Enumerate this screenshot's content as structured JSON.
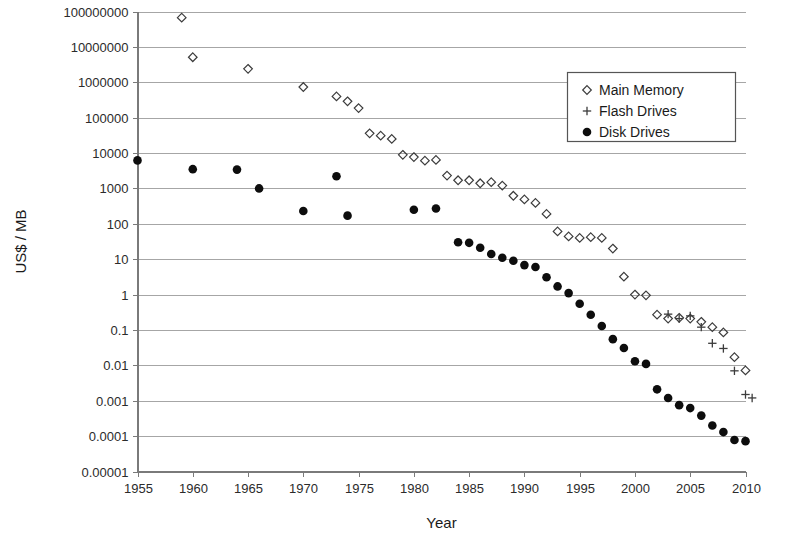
{
  "chart_data": {
    "type": "scatter",
    "title": "",
    "xlabel": "Year",
    "ylabel": "US$ / MB",
    "xlim": [
      1955,
      2010
    ],
    "ylim": [
      1e-05,
      100000000
    ],
    "yscale": "log",
    "xscale": "linear",
    "grid": "horizontal",
    "xticks": [
      1955,
      1960,
      1965,
      1970,
      1975,
      1980,
      1985,
      1990,
      1995,
      2000,
      2005,
      2010
    ],
    "xticklabels": [
      "1955",
      "1960",
      "1965",
      "1970",
      "1975",
      "1980",
      "1985",
      "1990",
      "1995",
      "2000",
      "2005",
      "2010"
    ],
    "yticks": [
      1e-05,
      0.0001,
      0.001,
      0.01,
      0.1,
      1,
      10,
      100,
      1000,
      10000,
      100000,
      1000000,
      10000000,
      100000000
    ],
    "yticklabels": [
      "0.00001",
      "0.0001",
      "0.001",
      "0.01",
      "0.1",
      "1",
      "10",
      "100",
      "1000",
      "10000",
      "100000",
      "1000000",
      "10000000",
      "100000000"
    ],
    "legend_position": "upper right",
    "series": [
      {
        "name": "Main Memory",
        "marker": "diamond",
        "color": "#3c3c3c",
        "points": [
          [
            1957,
            411000000
          ],
          [
            1959,
            67000000
          ],
          [
            1960,
            5100000
          ],
          [
            1965,
            2400000
          ],
          [
            1970,
            734000
          ],
          [
            1973,
            399000
          ],
          [
            1974,
            290000
          ],
          [
            1975,
            186000
          ],
          [
            1976,
            36000
          ],
          [
            1977,
            31000
          ],
          [
            1978,
            25000
          ],
          [
            1979,
            8900
          ],
          [
            1980,
            7700
          ],
          [
            1981,
            6100
          ],
          [
            1982,
            6400
          ],
          [
            1983,
            2300
          ],
          [
            1984,
            1700
          ],
          [
            1985,
            1700
          ],
          [
            1986,
            1400
          ],
          [
            1987,
            1500
          ],
          [
            1988,
            1200
          ],
          [
            1989,
            620
          ],
          [
            1990,
            490
          ],
          [
            1991,
            390
          ],
          [
            1992,
            190
          ],
          [
            1993,
            61
          ],
          [
            1994,
            44
          ],
          [
            1995,
            40
          ],
          [
            1996,
            42
          ],
          [
            1997,
            40
          ],
          [
            1998,
            20
          ],
          [
            1999,
            3.2
          ],
          [
            2000,
            1.0
          ],
          [
            2001,
            0.95
          ],
          [
            2002,
            0.27
          ],
          [
            2003,
            0.21
          ],
          [
            2004,
            0.22
          ],
          [
            2005,
            0.21
          ],
          [
            2006,
            0.17
          ],
          [
            2007,
            0.12
          ],
          [
            2008,
            0.085
          ],
          [
            2009,
            0.017
          ],
          [
            2010,
            0.0072
          ]
        ]
      },
      {
        "name": "Flash Drives",
        "marker": "plus",
        "color": "#3c3c3c",
        "points": [
          [
            2003,
            0.28
          ],
          [
            2004,
            0.21
          ],
          [
            2005,
            0.25
          ],
          [
            2006,
            0.12
          ],
          [
            2007,
            0.042
          ],
          [
            2008,
            0.03
          ],
          [
            2009,
            0.007
          ],
          [
            2010,
            0.0015
          ],
          [
            2010.6,
            0.0012
          ]
        ]
      },
      {
        "name": "Disk Drives",
        "marker": "circle",
        "color": "#0d0d0d",
        "points": [
          [
            1955,
            6200
          ],
          [
            1960,
            3500
          ],
          [
            1964,
            3400
          ],
          [
            1966,
            1000
          ],
          [
            1970,
            230
          ],
          [
            1973,
            2200
          ],
          [
            1974,
            170
          ],
          [
            1980,
            250
          ],
          [
            1982,
            270
          ],
          [
            1984,
            30
          ],
          [
            1985,
            29
          ],
          [
            1986,
            21
          ],
          [
            1987,
            14
          ],
          [
            1988,
            11
          ],
          [
            1989,
            9.0
          ],
          [
            1990,
            6.8
          ],
          [
            1991,
            6.0
          ],
          [
            1992,
            3.1
          ],
          [
            1993,
            1.7
          ],
          [
            1994,
            1.1
          ],
          [
            1995,
            0.55
          ],
          [
            1996,
            0.27
          ],
          [
            1997,
            0.13
          ],
          [
            1998,
            0.055
          ],
          [
            1999,
            0.031
          ],
          [
            2000,
            0.013
          ],
          [
            2001,
            0.011
          ],
          [
            2002,
            0.0021
          ],
          [
            2003,
            0.0012
          ],
          [
            2004,
            0.00075
          ],
          [
            2005,
            0.00062
          ],
          [
            2006,
            0.00038
          ],
          [
            2007,
            0.0002
          ],
          [
            2008,
            0.00013
          ],
          [
            2009,
            7.8e-05
          ],
          [
            2010,
            7.2e-05
          ]
        ]
      }
    ]
  },
  "legend": {
    "items": [
      {
        "label": "Main Memory",
        "marker": "diamond"
      },
      {
        "label": "Flash Drives",
        "marker": "plus"
      },
      {
        "label": "Disk Drives",
        "marker": "circle"
      }
    ]
  },
  "axes": {
    "x_title": "Year",
    "y_title": "US$ / MB"
  }
}
